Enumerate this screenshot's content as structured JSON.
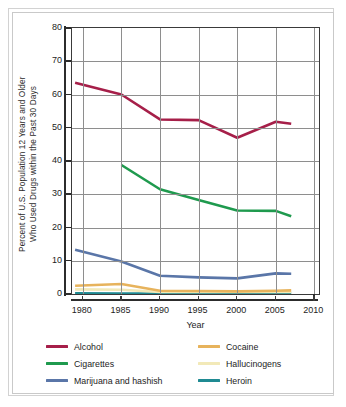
{
  "chart_data": {
    "type": "line",
    "title": "",
    "xlabel": "Year",
    "ylabel": "Percent of U.S. Population 12 Years and Older Who Used Drugs within the Past 30 Days",
    "ylabel_line1": "Percent of U.S. Population 12 Years and Older",
    "ylabel_line2": "Who Used Drugs within the Past 30 Days",
    "xlim": [
      1977.5,
      2011
    ],
    "ylim": [
      0,
      80
    ],
    "xticks": [
      1980,
      1985,
      1990,
      1995,
      2000,
      2005,
      2010
    ],
    "xtick_labels": [
      "1980",
      "1985",
      "1990",
      "1995",
      "2000",
      "2005",
      "2010"
    ],
    "yticks": [
      0,
      10,
      20,
      30,
      40,
      50,
      60,
      70,
      80
    ],
    "ytick_labels": [
      "0",
      "10",
      "20",
      "30",
      "40",
      "50",
      "60",
      "70",
      "80"
    ],
    "grid": true,
    "legend_position": "bottom",
    "plot_xmin": 1978.6,
    "plot_xmax": 2010.6,
    "series": [
      {
        "name": "Alcohol",
        "color": "#a61f49",
        "x": [
          1979,
          1985,
          1990,
          1995,
          2000,
          2005,
          2007
        ],
        "values": [
          63.5,
          60.0,
          52.5,
          52.3,
          47.0,
          51.8,
          51.2
        ]
      },
      {
        "name": "Cigarettes",
        "color": "#1f9a4e",
        "x": [
          1985,
          1990,
          1995,
          2000,
          2005,
          2007
        ],
        "values": [
          38.8,
          31.5,
          28.3,
          25.1,
          25.0,
          23.4
        ]
      },
      {
        "name": "Marijuana and hashish",
        "color": "#5a76a8",
        "x": [
          1979,
          1985,
          1990,
          1995,
          2000,
          2005,
          2007
        ],
        "values": [
          13.3,
          9.8,
          5.5,
          5.0,
          4.7,
          6.2,
          6.1
        ]
      },
      {
        "name": "Cocaine",
        "color": "#e7b35c",
        "x": [
          1979,
          1985,
          1990,
          1995,
          2000,
          2005,
          2007
        ],
        "values": [
          2.5,
          3.0,
          1.0,
          0.9,
          0.8,
          1.0,
          1.1
        ]
      },
      {
        "name": "Hallucinogens",
        "color": "#f2e9b8",
        "x": [
          1979,
          1985,
          1990,
          1995,
          2000,
          2005,
          2007
        ],
        "values": [
          1.4,
          1.3,
          0.6,
          0.6,
          0.6,
          0.6,
          0.6
        ]
      },
      {
        "name": "Heroin",
        "color": "#1f8a92",
        "x": [
          1979,
          1985,
          1990,
          1995,
          2000,
          2005,
          2007
        ],
        "values": [
          0.2,
          0.15,
          0.1,
          0.1,
          0.1,
          0.1,
          0.1
        ]
      }
    ]
  },
  "legend": {
    "items": [
      {
        "label": "Alcohol",
        "color": "#a61f49"
      },
      {
        "label": "Cigarettes",
        "color": "#1f9a4e"
      },
      {
        "label": "Marijuana and hashish",
        "color": "#5a76a8"
      },
      {
        "label": "Cocaine",
        "color": "#e7b35c"
      },
      {
        "label": "Hallucinogens",
        "color": "#f2e9b8"
      },
      {
        "label": "Heroin",
        "color": "#1f8a92"
      }
    ]
  }
}
